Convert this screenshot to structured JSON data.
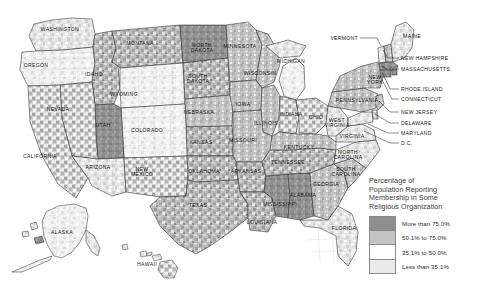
{
  "map": {
    "title": "Percentage of Population Reporting Membership in Some Religious Organization",
    "projection": "albers-usa",
    "background": "#ffffff",
    "outline_color": "#2b2b2b",
    "county_line_color": "#b9b9b9"
  },
  "legend": {
    "title": "Percentage of\nPopulation Reporting\nMembership in Some\nReligious Organization",
    "classes": [
      {
        "label": "More than 75.0%",
        "color": "#8e8e8e",
        "min": 75.0,
        "max": 100.0
      },
      {
        "label": "50.1% to 75.0%",
        "color": "#c4c4c4",
        "min": 50.1,
        "max": 75.0
      },
      {
        "label": "35.1% to 50.0%",
        "color": "#ffffff",
        "min": 35.1,
        "max": 50.0
      },
      {
        "label": "Less than 35.1%",
        "color": "#ececec",
        "min": 0.0,
        "max": 35.1
      }
    ]
  },
  "state_labels": [
    {
      "name": "WASHINGTON",
      "text": "WASHINGTON",
      "x": 60,
      "y": 30
    },
    {
      "name": "OREGON",
      "text": "OREGON",
      "x": 36,
      "y": 66
    },
    {
      "name": "IDAHO",
      "text": "IDAHO",
      "x": 94,
      "y": 75
    },
    {
      "name": "MONTANA",
      "text": "MONTANA",
      "x": 140,
      "y": 44
    },
    {
      "name": "NORTH-DAKOTA",
      "text": "NORTH\nDAKOTA",
      "x": 202,
      "y": 48
    },
    {
      "name": "MINNESOTA",
      "text": "MINNESOTA",
      "x": 240,
      "y": 47
    },
    {
      "name": "SOUTH-DAKOTA",
      "text": "SOUTH\nDAKOTA",
      "x": 198,
      "y": 79
    },
    {
      "name": "WYOMING",
      "text": "WYOMING",
      "x": 124,
      "y": 95
    },
    {
      "name": "NEVADA",
      "text": "NEVADA",
      "x": 58,
      "y": 110
    },
    {
      "name": "UTAH",
      "text": "UTAH",
      "x": 103,
      "y": 126
    },
    {
      "name": "COLORADO",
      "text": "COLORADO",
      "x": 147,
      "y": 131
    },
    {
      "name": "NEBRASKA",
      "text": "NEBRASKA",
      "x": 199,
      "y": 113
    },
    {
      "name": "IOWA",
      "text": "IOWA",
      "x": 243,
      "y": 105
    },
    {
      "name": "WISCONSIN",
      "text": "WISCONSIN",
      "x": 260,
      "y": 74
    },
    {
      "name": "MICHIGAN",
      "text": "MICHIGAN",
      "x": 291,
      "y": 62
    },
    {
      "name": "ILLINOIS",
      "text": "ILLINOIS",
      "x": 266,
      "y": 124
    },
    {
      "name": "INDIANA",
      "text": "INDIANA",
      "x": 291,
      "y": 115
    },
    {
      "name": "OHIO",
      "text": "OHIO",
      "x": 316,
      "y": 118
    },
    {
      "name": "KANSAS",
      "text": "KANSAS",
      "x": 201,
      "y": 143
    },
    {
      "name": "MISSOURI",
      "text": "MISSOURI",
      "x": 243,
      "y": 141
    },
    {
      "name": "KENTUCKY",
      "text": "KENTUCKY",
      "x": 299,
      "y": 148
    },
    {
      "name": "TENNESSEE",
      "text": "TENNESSEE",
      "x": 288,
      "y": 163
    },
    {
      "name": "CALIFORNIA",
      "text": "CALIFORNIA",
      "x": 40,
      "y": 157
    },
    {
      "name": "ARIZONA",
      "text": "ARIZONA",
      "x": 98,
      "y": 168
    },
    {
      "name": "NEW-MEXICO",
      "text": "NEW\nMEXICO",
      "x": 142,
      "y": 172
    },
    {
      "name": "OKLAHOMA",
      "text": "OKLAHOMA",
      "x": 204,
      "y": 172
    },
    {
      "name": "ARKANSAS",
      "text": "ARKANSAS",
      "x": 246,
      "y": 172
    },
    {
      "name": "TEXAS",
      "text": "TEXAS",
      "x": 198,
      "y": 206
    },
    {
      "name": "LOUISIANA",
      "text": "LOUISIANA",
      "x": 262,
      "y": 223
    },
    {
      "name": "MISSISSIPPI",
      "text": "MISSISSIPPI",
      "x": 280,
      "y": 205
    },
    {
      "name": "ALABAMA",
      "text": "ALABAMA",
      "x": 303,
      "y": 196
    },
    {
      "name": "GEORGIA",
      "text": "GEORGIA",
      "x": 326,
      "y": 185
    },
    {
      "name": "FLORIDA",
      "text": "FLORIDA",
      "x": 344,
      "y": 229
    },
    {
      "name": "SOUTH-CAROLINA",
      "text": "SOUTH\nCAROLINA",
      "x": 346,
      "y": 172
    },
    {
      "name": "NORTH-CAROLINA",
      "text": "NORTH\nCAROLINA",
      "x": 348,
      "y": 155
    },
    {
      "name": "VIRGINIA",
      "text": "VIRGINIA",
      "x": 352,
      "y": 137
    },
    {
      "name": "WEST-VIRGINIA",
      "text": "WEST\nVIRGINIA",
      "x": 337,
      "y": 123
    },
    {
      "name": "PENNSYLVANIA",
      "text": "PENNSYLVANIA",
      "x": 357,
      "y": 101
    },
    {
      "name": "NEW-YORK",
      "text": "NEW\nYORK",
      "x": 375,
      "y": 80
    },
    {
      "name": "MAINE",
      "text": "MAINE",
      "x": 412,
      "y": 37
    },
    {
      "name": "ALASKA",
      "text": "ALASKA",
      "x": 62,
      "y": 233
    },
    {
      "name": "HAWAII",
      "text": "HAWAII",
      "x": 147,
      "y": 265
    }
  ],
  "callout_labels": [
    {
      "name": "VERMONT",
      "text": "VERMONT",
      "x": 358,
      "y": 38,
      "align": "right",
      "line": [
        [
          360,
          38
        ],
        [
          377,
          38
        ],
        [
          381,
          46
        ]
      ]
    },
    {
      "name": "NEW-HAMPSHIRE",
      "text": "NEW HAMPSHIRE",
      "x": 401,
      "y": 58,
      "align": "left",
      "line": [
        [
          399,
          58
        ],
        [
          388,
          58
        ],
        [
          383,
          50
        ]
      ]
    },
    {
      "name": "MASSACHUSETTS",
      "text": "MASSACHUSETTS",
      "x": 401,
      "y": 69,
      "align": "left",
      "line": [
        [
          399,
          69
        ],
        [
          386,
          69
        ],
        [
          382,
          66
        ]
      ]
    },
    {
      "name": "RHODE-ISLAND",
      "text": "RHODE ISLAND",
      "x": 401,
      "y": 89,
      "align": "left",
      "line": [
        [
          399,
          89
        ],
        [
          390,
          89
        ],
        [
          382,
          72
        ]
      ]
    },
    {
      "name": "CONNECTICUT",
      "text": "CONNECTICUT",
      "x": 401,
      "y": 99,
      "align": "left",
      "line": [
        [
          399,
          99
        ],
        [
          392,
          99
        ],
        [
          380,
          76
        ]
      ]
    },
    {
      "name": "NEW-JERSEY",
      "text": "NEW JERSEY",
      "x": 401,
      "y": 112,
      "align": "left",
      "line": [
        [
          399,
          112
        ],
        [
          390,
          112
        ],
        [
          379,
          101
        ]
      ]
    },
    {
      "name": "DELAWARE",
      "text": "DELAWARE",
      "x": 401,
      "y": 123,
      "align": "left",
      "line": [
        [
          399,
          123
        ],
        [
          390,
          123
        ],
        [
          375,
          114
        ]
      ]
    },
    {
      "name": "MARYLAND",
      "text": "MARYLAND",
      "x": 401,
      "y": 133,
      "align": "left",
      "line": [
        [
          399,
          133
        ],
        [
          388,
          133
        ],
        [
          368,
          124
        ]
      ]
    },
    {
      "name": "D-C",
      "text": "D.C.",
      "x": 401,
      "y": 143,
      "align": "left",
      "line": [
        [
          399,
          143
        ],
        [
          390,
          143
        ],
        [
          364,
          131
        ]
      ]
    }
  ]
}
